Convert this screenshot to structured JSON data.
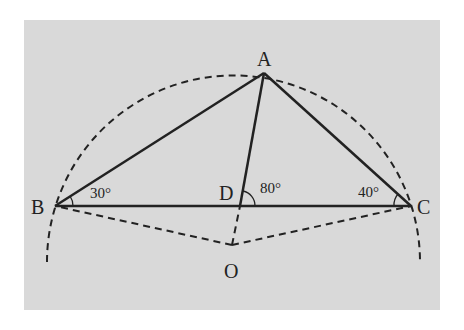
{
  "diagram": {
    "background_color": "#d9d9d9",
    "points": {
      "A": {
        "label": "A",
        "x": 264,
        "y": 73
      },
      "B": {
        "label": "B",
        "x": 55,
        "y": 206
      },
      "C": {
        "label": "C",
        "x": 411,
        "y": 206
      },
      "D": {
        "label": "D",
        "x": 240,
        "y": 206
      },
      "O": {
        "label": "O",
        "x": 232,
        "y": 245
      }
    },
    "angles": {
      "B": "30°",
      "C": "40°",
      "ADC": "80°"
    },
    "solid_segments": [
      "AB",
      "AC",
      "BC",
      "AD"
    ],
    "dashed_segments": [
      "OB",
      "OC",
      "OD"
    ],
    "dashed_arc": "circumcircle centered at O through A, B, C"
  }
}
